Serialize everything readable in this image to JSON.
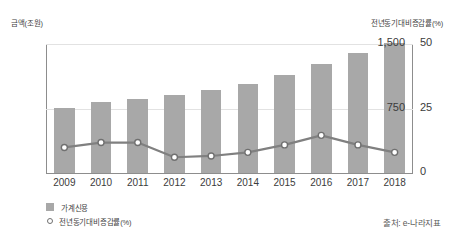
{
  "chart_data": {
    "type": "bar",
    "title": "",
    "categories": [
      "2009",
      "2010",
      "2011",
      "2012",
      "2013",
      "2014",
      "2015",
      "2016",
      "2017",
      "2018"
    ],
    "series": [
      {
        "name": "가계신용",
        "type": "bar",
        "axis": "left",
        "unit": "조원",
        "values": [
          755,
          825,
          865,
          905,
          960,
          1030,
          1140,
          1270,
          1400,
          1510
        ]
      },
      {
        "name": "전년동기대비증감률(%)",
        "type": "line",
        "axis": "right",
        "unit": "%",
        "values": [
          9.9,
          11.8,
          11.8,
          6.1,
          6.6,
          8.0,
          10.9,
          14.6,
          10.9,
          8.0
        ]
      }
    ],
    "xlabel": "",
    "ylabel_left": "금액(조원)",
    "ylabel_right": "전년동기대비증감률(%)",
    "ylim_left": [
      0,
      1500
    ],
    "ylim_right": [
      0,
      50
    ],
    "yticks_left": [
      "750",
      "1,500"
    ],
    "yticks_left_values": [
      750,
      1500
    ],
    "yticks_right": [
      "0",
      "25",
      "50"
    ],
    "yticks_right_values": [
      0,
      25,
      50
    ],
    "grid": true,
    "legend_position": "bottom-left",
    "bar_color": "#a8a8a8",
    "line_color": "#808080",
    "marker_fill": "#ffffff",
    "marker_edge": "#707070",
    "grid_color": "#e2e2e2",
    "axis_color": "#8d8d8d",
    "text_color": "#3b3b3b"
  },
  "axes": {
    "left_title": "금액(조원)",
    "right_title": "전년동기대비증감률(%)"
  },
  "legend": {
    "items": [
      {
        "label": "가계신용",
        "marker": "filled-square"
      },
      {
        "label": "전년동기대비증감률(%)",
        "marker": "hollow-circle"
      }
    ]
  },
  "source": {
    "text": "출처: e-나라지표"
  }
}
